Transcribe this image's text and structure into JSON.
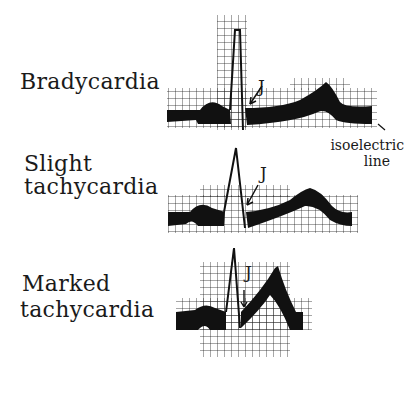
{
  "panels": [
    {
      "id": "bradycardia",
      "label_lines": [
        "Bradycardia"
      ],
      "j_label": "J"
    },
    {
      "id": "slight",
      "label_lines": [
        "Slight",
        "tachycardia"
      ],
      "j_label": "J"
    },
    {
      "id": "marked",
      "label_lines": [
        "Marked",
        "tachycardia"
      ],
      "j_label": "J"
    }
  ],
  "annotation": {
    "line1": "isoelectric",
    "line2": "line"
  },
  "colors": {
    "ink": "#1a1a1a",
    "paper": "#ffffff"
  }
}
